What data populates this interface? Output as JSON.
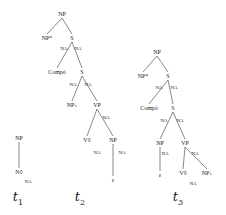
{
  "trees": [
    {
      "name": "t",
      "index": "1",
      "nodes": [
        {
          "id": "t1_np",
          "label": "NP",
          "x": 19,
          "y": 138
        },
        {
          "id": "t1_n",
          "label": "N◊",
          "x": 19,
          "y": 172
        },
        {
          "id": "t1_na",
          "label": "NA",
          "x": 28,
          "y": 181,
          "type": "na"
        }
      ],
      "edges": [
        [
          "t1_np",
          "t1_n"
        ]
      ],
      "caption_pos": [
        18,
        198
      ]
    },
    {
      "name": "t",
      "index": "2",
      "nodes": [
        {
          "id": "t2_np",
          "label": "NP",
          "x": 62,
          "y": 14
        },
        {
          "id": "t2_npstar",
          "label": "NP*",
          "x": 47,
          "y": 38
        },
        {
          "id": "t2_s1",
          "label": "S",
          "x": 72,
          "y": 38
        },
        {
          "id": "t2_na1",
          "label": "NA",
          "x": 64,
          "y": 48,
          "type": "na"
        },
        {
          "id": "t2_na2",
          "label": "NA",
          "x": 78,
          "y": 48,
          "type": "na"
        },
        {
          "id": "t2_comp",
          "label": "Compó",
          "x": 57,
          "y": 72
        },
        {
          "id": "t2_s2",
          "label": "S",
          "x": 82,
          "y": 72
        },
        {
          "id": "t2_na3",
          "label": "NA",
          "x": 73,
          "y": 84,
          "type": "na"
        },
        {
          "id": "t2_na4",
          "label": "NA",
          "x": 88,
          "y": 84,
          "type": "na"
        },
        {
          "id": "t2_npdown",
          "label": "NP↓",
          "x": 72,
          "y": 105
        },
        {
          "id": "t2_vp",
          "label": "VP",
          "x": 97,
          "y": 105
        },
        {
          "id": "t2_na5",
          "label": "NA",
          "x": 106,
          "y": 117,
          "type": "na"
        },
        {
          "id": "t2_v",
          "label": "V◊",
          "x": 87,
          "y": 140
        },
        {
          "id": "t2_np2",
          "label": "NP",
          "x": 113,
          "y": 140
        },
        {
          "id": "t2_na6",
          "label": "NA",
          "x": 97,
          "y": 152,
          "type": "na"
        },
        {
          "id": "t2_na7",
          "label": "NA",
          "x": 122,
          "y": 152,
          "type": "na"
        },
        {
          "id": "t2_eps",
          "label": "ε",
          "x": 113,
          "y": 180
        }
      ],
      "edges": [
        [
          "t2_np",
          "t2_npstar"
        ],
        [
          "t2_np",
          "t2_s1"
        ],
        [
          "t2_s1",
          "t2_comp"
        ],
        [
          "t2_s1",
          "t2_s2"
        ],
        [
          "t2_s2",
          "t2_npdown"
        ],
        [
          "t2_s2",
          "t2_vp"
        ],
        [
          "t2_vp",
          "t2_v"
        ],
        [
          "t2_vp",
          "t2_np2"
        ],
        [
          "t2_np2",
          "t2_eps"
        ]
      ],
      "caption_pos": [
        80,
        198
      ]
    },
    {
      "name": "t",
      "index": "3",
      "nodes": [
        {
          "id": "t3_np",
          "label": "NP",
          "x": 157,
          "y": 52
        },
        {
          "id": "t3_npstar",
          "label": "NP*",
          "x": 143,
          "y": 76
        },
        {
          "id": "t3_s1",
          "label": "S",
          "x": 168,
          "y": 76
        },
        {
          "id": "t3_na1",
          "label": "NA",
          "x": 159,
          "y": 87,
          "type": "na"
        },
        {
          "id": "t3_na2",
          "label": "NA",
          "x": 174,
          "y": 87,
          "type": "na"
        },
        {
          "id": "t3_comp",
          "label": "Compó",
          "x": 149,
          "y": 108
        },
        {
          "id": "t3_s2",
          "label": "S",
          "x": 173,
          "y": 108
        },
        {
          "id": "t3_na3",
          "label": "NA",
          "x": 164,
          "y": 120,
          "type": "na"
        },
        {
          "id": "t3_na4",
          "label": "NA",
          "x": 180,
          "y": 120,
          "type": "na"
        },
        {
          "id": "t3_np2",
          "label": "NP",
          "x": 160,
          "y": 143
        },
        {
          "id": "t3_vp",
          "label": "VP",
          "x": 185,
          "y": 143
        },
        {
          "id": "t3_na5",
          "label": "NA",
          "x": 165,
          "y": 153,
          "type": "na"
        },
        {
          "id": "t3_na6",
          "label": "NA",
          "x": 195,
          "y": 153,
          "type": "na"
        },
        {
          "id": "t3_eps",
          "label": "ε",
          "x": 160,
          "y": 175
        },
        {
          "id": "t3_v",
          "label": "V◊",
          "x": 183,
          "y": 173
        },
        {
          "id": "t3_npdown",
          "label": "NP↓",
          "x": 207,
          "y": 173
        },
        {
          "id": "t3_na7",
          "label": "NA",
          "x": 193,
          "y": 183,
          "type": "na"
        }
      ],
      "edges": [
        [
          "t3_np",
          "t3_npstar"
        ],
        [
          "t3_np",
          "t3_s1"
        ],
        [
          "t3_s1",
          "t3_comp"
        ],
        [
          "t3_s1",
          "t3_s2"
        ],
        [
          "t3_s2",
          "t3_np2"
        ],
        [
          "t3_s2",
          "t3_vp"
        ],
        [
          "t3_np2",
          "t3_eps"
        ],
        [
          "t3_vp",
          "t3_v"
        ],
        [
          "t3_vp",
          "t3_npdown"
        ]
      ],
      "caption_pos": [
        178,
        198
      ]
    }
  ],
  "subscripts": {
    "star": "*",
    "down": "↓",
    "i": "i"
  }
}
